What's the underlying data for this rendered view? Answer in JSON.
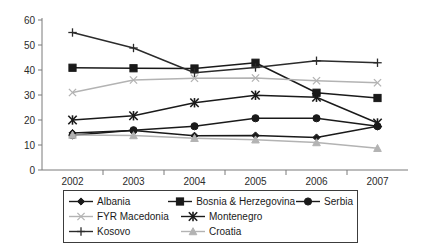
{
  "chart_data": {
    "type": "line",
    "title": "",
    "xlabel": "",
    "ylabel": "",
    "categories": [
      "2002",
      "2003",
      "2004",
      "2005",
      "2006",
      "2007"
    ],
    "x": [
      2002,
      2003,
      2004,
      2005,
      2006,
      2007
    ],
    "ylim": [
      0,
      60
    ],
    "yticks": [
      0,
      10,
      20,
      30,
      40,
      50,
      60
    ],
    "ytick_labels": [
      "0",
      "10",
      "20",
      "30",
      "40",
      "50",
      "60"
    ],
    "grid": false,
    "legend_position": "bottom",
    "series": [
      {
        "name": "Albania",
        "marker": "diamond",
        "color": "#1a1a1a",
        "values": [
          14.8,
          15.8,
          13.7,
          13.8,
          13.0,
          17.5
        ]
      },
      {
        "name": "Bosnia & Herzegovina",
        "marker": "square",
        "color": "#1a1a1a",
        "values": [
          40.9,
          40.7,
          40.6,
          42.9,
          30.9,
          28.8
        ]
      },
      {
        "name": "Serbia",
        "marker": "circle",
        "color": "#1a1a1a",
        "values": [
          13.9,
          15.9,
          17.5,
          20.7,
          20.7,
          17.5
        ]
      },
      {
        "name": "FYR Macedonia",
        "marker": "x-thin",
        "color": "#b3b3b3",
        "values": [
          31.0,
          36.0,
          36.7,
          36.8,
          35.7,
          34.9
        ]
      },
      {
        "name": "Montenegro",
        "marker": "asterisk",
        "color": "#1a1a1a",
        "values": [
          20.0,
          21.7,
          26.9,
          29.9,
          29.1,
          18.8
        ]
      },
      {
        "name": "Kosovo",
        "marker": "plus",
        "color": "#2b2b2b",
        "values": [
          55.0,
          48.8,
          38.9,
          41.0,
          43.7,
          42.9
        ]
      },
      {
        "name": "Croatia",
        "marker": "triangle",
        "color": "#b3b3b3",
        "values": [
          14.0,
          13.8,
          12.7,
          12.1,
          11.0,
          8.7
        ]
      }
    ]
  },
  "legend": {
    "rows": [
      [
        "Albania",
        "Bosnia & Herzegovina",
        "Serbia"
      ],
      [
        "FYR Macedonia",
        "Montenegro"
      ],
      [
        "Kosovo",
        "Croatia"
      ]
    ]
  },
  "colors": {
    "axis": "#7a7a7a",
    "dark_series": "#1a1a1a",
    "light_series": "#b3b3b3",
    "legend_border": "#3c3c3c",
    "background": "#ffffff"
  }
}
